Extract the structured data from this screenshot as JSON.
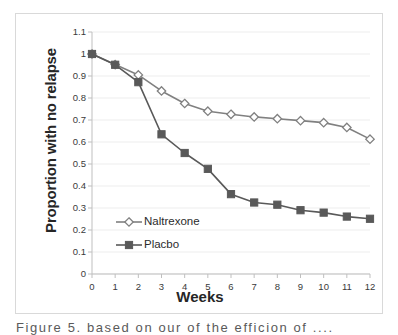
{
  "figure": {
    "caption": "Figure 5.  based on our of the efficion of ...."
  },
  "chart_data": {
    "type": "line",
    "title": "",
    "xlabel": "Weeks",
    "ylabel": "Proportion with no relapse",
    "x": [
      0,
      1,
      2,
      3,
      4,
      5,
      6,
      7,
      8,
      9,
      10,
      11,
      12
    ],
    "xtick_labels": [
      "0",
      "1",
      "2",
      "3",
      "4",
      "5",
      "6",
      "7",
      "8",
      "9",
      "10",
      "11",
      "12"
    ],
    "ytick_labels": [
      "0",
      "0.1",
      "0.2",
      "0.3",
      "0.4",
      "0.5",
      "0.6",
      "0.7",
      "0.8",
      "0.9",
      "1",
      "1.1"
    ],
    "ytick_values": [
      0,
      0.1,
      0.2,
      0.3,
      0.4,
      0.5,
      0.6,
      0.7,
      0.8,
      0.9,
      1,
      1.1
    ],
    "xlim": [
      0,
      12
    ],
    "ylim": [
      0,
      1.1
    ],
    "grid": "horizontal",
    "legend_position": "inside-lower-left",
    "series": [
      {
        "name": "Naltrexone",
        "color": "#808080",
        "marker": "open-diamond",
        "values": [
          1.0,
          0.952,
          0.905,
          0.832,
          0.775,
          0.74,
          0.726,
          0.714,
          0.706,
          0.697,
          0.688,
          0.666,
          0.613
        ]
      },
      {
        "name": "Placbo",
        "color": "#595959",
        "marker": "filled-square",
        "values": [
          1.0,
          0.951,
          0.872,
          0.635,
          0.55,
          0.478,
          0.363,
          0.325,
          0.315,
          0.29,
          0.279,
          0.261,
          0.251
        ]
      }
    ]
  }
}
